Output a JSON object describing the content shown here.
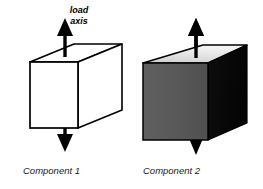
{
  "figure": {
    "background_color": "#ffffff",
    "annotation": {
      "load_axis_line1": "load",
      "load_axis_line2": "axis"
    },
    "components": [
      {
        "id": "component-1",
        "caption": "Component 1",
        "style": "wireframe",
        "face_colors": {
          "top": "#ffffff",
          "front": "#ffffff",
          "side": "#ffffff"
        },
        "outline_color": "#000000",
        "arrows": {
          "top_direction": "up",
          "bottom_direction": "down",
          "color": "#000000"
        }
      },
      {
        "id": "component-2",
        "caption": "Component 2",
        "style": "shaded",
        "face_colors": {
          "top": "#e2e2e2",
          "front": "#595959",
          "side": "#0a0a0a"
        },
        "outline_color": "#000000",
        "arrows": {
          "top_direction": "up",
          "bottom_direction": "down",
          "color": "#000000"
        }
      }
    ]
  }
}
